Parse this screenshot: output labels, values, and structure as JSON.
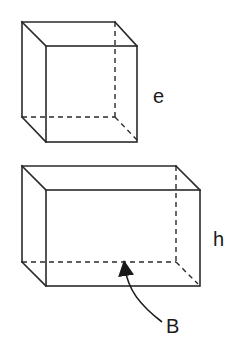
{
  "diagram": {
    "type": "3d-solids",
    "stroke_color": "#2a2a2a",
    "shapes": [
      {
        "name": "cube",
        "labels": [
          {
            "text": "e",
            "meaning": "edge length"
          }
        ]
      },
      {
        "name": "rectangular-prism",
        "labels": [
          {
            "text": "h",
            "meaning": "height"
          },
          {
            "text": "B",
            "meaning": "base area"
          }
        ]
      }
    ]
  },
  "labels": {
    "cube_edge": "e",
    "prism_height": "h",
    "prism_base": "B"
  }
}
